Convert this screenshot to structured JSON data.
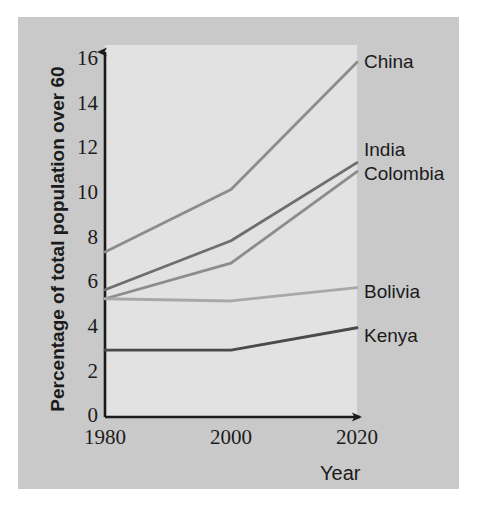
{
  "chart_data": {
    "type": "line",
    "title": "",
    "xlabel": "Year",
    "ylabel": "Percentage of total population over 60",
    "x": [
      1980,
      2000,
      2020
    ],
    "xticklabels": [
      "1980",
      "2000",
      "2020"
    ],
    "yticklabels": [
      "0",
      "2",
      "4",
      "6",
      "8",
      "10",
      "12",
      "14",
      "16"
    ],
    "yticks": [
      0,
      2,
      4,
      6,
      8,
      10,
      12,
      14,
      16
    ],
    "xlim": [
      1980,
      2020
    ],
    "ylim": [
      0,
      16
    ],
    "grid": false,
    "legend_position": "right-of-line-ends",
    "series": [
      {
        "name": "China",
        "values": [
          7.4,
          10.2,
          15.9
        ],
        "color": "#8c8c8c"
      },
      {
        "name": "India",
        "values": [
          5.7,
          7.9,
          11.4
        ],
        "color": "#6e6e6e"
      },
      {
        "name": "Colombia",
        "values": [
          5.3,
          6.9,
          11.0
        ],
        "color": "#8c8c8c"
      },
      {
        "name": "Bolivia",
        "values": [
          5.3,
          5.2,
          5.8
        ],
        "color": "#a8a8a8"
      },
      {
        "name": "Kenya",
        "values": [
          3.0,
          3.0,
          4.0
        ],
        "color": "#4a4a4a"
      }
    ]
  },
  "axes": {
    "y_tick_0": "0",
    "y_tick_2": "2",
    "y_tick_4": "4",
    "y_tick_6": "6",
    "y_tick_8": "8",
    "y_tick_10": "10",
    "y_tick_12": "12",
    "y_tick_14": "14",
    "y_tick_16": "16",
    "x_tick_1980": "1980",
    "x_tick_2000": "2000",
    "x_tick_2020": "2020",
    "y_axis_title": "Percentage of total population over 60",
    "x_axis_title": "Year"
  },
  "series_labels": {
    "china": "China",
    "india": "India",
    "colombia": "Colombia",
    "bolivia": "Bolivia",
    "kenya": "Kenya"
  },
  "colors": {
    "plate_background": "#c9c9c9",
    "panel_background": "#e2e2e2",
    "axis": "#1b1b1b",
    "text": "#1b1b1b"
  }
}
